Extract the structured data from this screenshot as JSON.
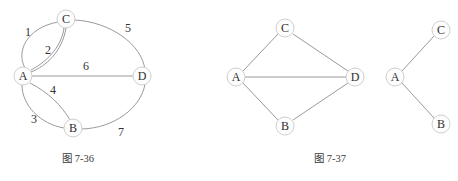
{
  "page": {
    "background_color": "#ffffff",
    "node_fill": "#fdfdfd",
    "node_stroke": "#cfcfcf",
    "edge_color": "#9a9a9a",
    "text_color": "#2f2f2f"
  },
  "figures": [
    {
      "id": "figure-7-36",
      "caption": "图 7-36",
      "caption_x": 78,
      "caption_y": 158,
      "nodes": [
        {
          "label": "C",
          "x": 66,
          "y": 19,
          "r": 9
        },
        {
          "label": "A",
          "x": 23,
          "y": 76,
          "r": 9
        },
        {
          "label": "D",
          "x": 142,
          "y": 76,
          "r": 9
        },
        {
          "label": "B",
          "x": 73,
          "y": 128,
          "r": 9
        }
      ],
      "edges": [
        {
          "weight": "1",
          "from": "A",
          "to": "C",
          "shape": "curve-left",
          "label_x": 28,
          "label_y": 32
        },
        {
          "weight": "2",
          "from": "A",
          "to": "C",
          "shape": "curve-right",
          "label_x": 48,
          "label_y": 50
        },
        {
          "weight": "3",
          "from": "A",
          "to": "B",
          "shape": "curve-left",
          "label_x": 34,
          "label_y": 119
        },
        {
          "weight": "4",
          "from": "A",
          "to": "B",
          "shape": "curve-right",
          "label_x": 53,
          "label_y": 90
        },
        {
          "weight": "5",
          "from": "C",
          "to": "D",
          "shape": "arc-outer",
          "label_x": 128,
          "label_y": 28
        },
        {
          "weight": "6",
          "from": "A",
          "to": "D",
          "shape": "straight",
          "label_x": 86,
          "label_y": 66
        },
        {
          "weight": "7",
          "from": "B",
          "to": "D",
          "shape": "arc-outer",
          "label_x": 121,
          "label_y": 132
        }
      ]
    },
    {
      "id": "figure-7-37-left",
      "caption": "图 7-37",
      "caption_x": 330,
      "caption_y": 158,
      "nodes": [
        {
          "label": "C",
          "x": 285,
          "y": 28,
          "r": 9
        },
        {
          "label": "A",
          "x": 236,
          "y": 77,
          "r": 9
        },
        {
          "label": "D",
          "x": 355,
          "y": 77,
          "r": 9
        },
        {
          "label": "B",
          "x": 285,
          "y": 126,
          "r": 9
        }
      ],
      "edges": [
        {
          "weight": "",
          "from": "A",
          "to": "C",
          "shape": "straight",
          "label_x": 0,
          "label_y": 0
        },
        {
          "weight": "",
          "from": "C",
          "to": "D",
          "shape": "straight",
          "label_x": 0,
          "label_y": 0
        },
        {
          "weight": "",
          "from": "A",
          "to": "D",
          "shape": "straight",
          "label_x": 0,
          "label_y": 0
        },
        {
          "weight": "",
          "from": "A",
          "to": "B",
          "shape": "straight",
          "label_x": 0,
          "label_y": 0
        },
        {
          "weight": "",
          "from": "B",
          "to": "D",
          "shape": "straight",
          "label_x": 0,
          "label_y": 0
        }
      ]
    },
    {
      "id": "figure-7-37-right",
      "caption": "",
      "caption_x": 0,
      "caption_y": 0,
      "nodes": [
        {
          "label": "C",
          "x": 441,
          "y": 30,
          "r": 9
        },
        {
          "label": "A",
          "x": 395,
          "y": 77,
          "r": 9
        },
        {
          "label": "B",
          "x": 441,
          "y": 124,
          "r": 9
        }
      ],
      "edges": [
        {
          "weight": "",
          "from": "A",
          "to": "C",
          "shape": "straight",
          "label_x": 0,
          "label_y": 0
        },
        {
          "weight": "",
          "from": "A",
          "to": "B",
          "shape": "straight",
          "label_x": 0,
          "label_y": 0
        }
      ]
    }
  ]
}
